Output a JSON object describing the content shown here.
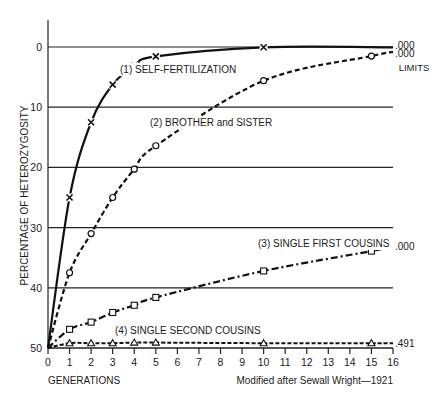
{
  "chart_data": {
    "type": "line",
    "title": "",
    "xlabel": "GENERATIONS",
    "ylabel": "PERCENTAGE OF HETEROZYGOSITY",
    "xlim": [
      0,
      16
    ],
    "ylim": [
      0,
      50
    ],
    "y_inverted": true,
    "grid": "horizontal",
    "x_ticks": [
      0,
      1,
      2,
      3,
      4,
      5,
      6,
      7,
      8,
      9,
      10,
      11,
      12,
      13,
      14,
      15,
      16
    ],
    "y_ticks": [
      0,
      10,
      20,
      30,
      40,
      50
    ],
    "limits_label": "LIMITS",
    "credit": "Modified after Sewall Wright—1921",
    "series": [
      {
        "name": "(1) SELF-FERTILIZATION",
        "marker": "x",
        "line_style": "solid",
        "x": [
          0,
          1,
          2,
          3,
          4,
          5,
          10
        ],
        "values": [
          50,
          25,
          12.5,
          6.25,
          3.13,
          1.56,
          0.05
        ],
        "limit": ".000"
      },
      {
        "name": "(2) BROTHER and SISTER",
        "marker": "o",
        "line_style": "dashed",
        "x": [
          0,
          1,
          2,
          3,
          4,
          5,
          10,
          15
        ],
        "values": [
          50,
          37.5,
          31,
          25,
          20.3,
          16.4,
          5.6,
          1.5
        ],
        "limit": ".000"
      },
      {
        "name": "(3) SINGLE FIRST COUSINS",
        "marker": "square",
        "line_style": "dash-dot",
        "x": [
          0,
          1,
          2,
          3,
          4,
          5,
          10,
          15
        ],
        "values": [
          50,
          46.9,
          45.7,
          44.1,
          42.9,
          41.6,
          37.2,
          33.9
        ],
        "limit": ".000"
      },
      {
        "name": "(4) SINGLE SECOND COUSINS",
        "marker": "triangle",
        "line_style": "dotted-dashed",
        "x": [
          0,
          1,
          2,
          3,
          4,
          5,
          10,
          15
        ],
        "values": [
          50,
          49.2,
          49.2,
          49.2,
          49.1,
          49.1,
          49.2,
          49.2
        ],
        "limit": ".491"
      }
    ]
  }
}
